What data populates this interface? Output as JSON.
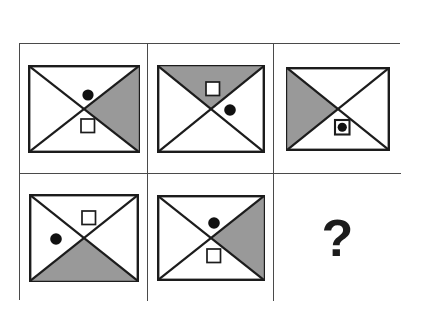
{
  "page": {
    "title": "Matrix Reasoning Puzzle",
    "background_color": "#ffffff"
  },
  "palette": {
    "shade_gray": "#999999",
    "line_black": "#1c1c1c",
    "grid_line": "#4a4a4a",
    "marker_black": "#111111",
    "cell_background": "#ffffff"
  },
  "grid": {
    "rows": 2,
    "columns": 3,
    "total_cells": 6
  },
  "legend": {
    "shaded_triangle_label": "shaded-triangle",
    "filled_circle_label": "filled-circle",
    "open_square_label": "open-square",
    "circle_in_square_label": "filled-circle-in-open-square"
  },
  "cells": [
    {
      "id": "cell-1",
      "position": "row1-col1",
      "shaded_triangle": "right",
      "markers": [
        {
          "shape": "filled-circle",
          "region": "top",
          "cx": 60,
          "cy": 30,
          "r": 5.6
        },
        {
          "shape": "open-square",
          "region": "bottom",
          "x": 53,
          "y": 54,
          "size": 13.5
        }
      ],
      "answer_slot": false,
      "label": "Cell 1"
    },
    {
      "id": "cell-2",
      "position": "row1-col2",
      "shaded_triangle": "top",
      "markers": [
        {
          "shape": "open-square",
          "region": "top",
          "x": 49,
          "y": 17,
          "size": 13.5
        },
        {
          "shape": "filled-circle",
          "region": "right",
          "cx": 73,
          "cy": 45,
          "r": 5.8
        }
      ],
      "answer_slot": false,
      "label": "Cell 2"
    },
    {
      "id": "cell-3",
      "position": "row1-col3",
      "shaded_triangle": "left",
      "markers": [
        {
          "shape": "filled-circle-in-open-square",
          "region": "bottom",
          "x": 49,
          "y": 53,
          "size": 14.5
        }
      ],
      "answer_slot": false,
      "label": "Cell 3"
    },
    {
      "id": "cell-4",
      "position": "row2-col1",
      "shaded_triangle": "bottom",
      "markers": [
        {
          "shape": "open-square",
          "region": "top",
          "x": 53,
          "y": 17,
          "size": 13.5
        },
        {
          "shape": "filled-circle",
          "region": "left",
          "cx": 27,
          "cy": 45,
          "r": 5.8
        }
      ],
      "answer_slot": false,
      "label": "Cell 4"
    },
    {
      "id": "cell-5",
      "position": "row2-col2",
      "shaded_triangle": "right",
      "markers": [
        {
          "shape": "filled-circle",
          "region": "top",
          "cx": 57,
          "cy": 28,
          "r": 5.8
        },
        {
          "shape": "open-square",
          "region": "bottom",
          "x": 50,
          "y": 54,
          "size": 13.5
        }
      ],
      "answer_slot": false,
      "label": "Cell 5"
    },
    {
      "id": "cell-6",
      "position": "row2-col3",
      "shaded_triangle": "none",
      "markers": [],
      "answer_slot": true,
      "question_mark": "?",
      "label": "Cell 6"
    }
  ]
}
